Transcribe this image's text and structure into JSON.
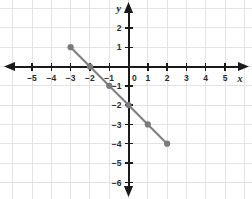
{
  "chart_data": {
    "type": "line",
    "title": "",
    "xlabel": "x",
    "ylabel": "y",
    "xlim": [
      -5.8,
      5.8
    ],
    "ylim": [
      -6.8,
      2.6
    ],
    "grid": true,
    "legend": false,
    "x_ticks": [
      -5,
      -4,
      -3,
      -2,
      -1,
      0,
      1,
      2,
      3,
      4,
      5
    ],
    "x_tick_labels": [
      "−5",
      "−4",
      "−3",
      "−2",
      "−1",
      "0",
      "1",
      "2",
      "3",
      "4",
      "5"
    ],
    "y_ticks": [
      2,
      1,
      -1,
      -2,
      -3,
      -4,
      -5,
      -6
    ],
    "y_tick_labels": [
      "2",
      "1",
      "−1",
      "−2",
      "−3",
      "−4",
      "−5",
      "−6"
    ],
    "series": [
      {
        "name": "line",
        "color": "#808080",
        "x": [
          -3,
          -2,
          -1,
          0,
          1,
          2
        ],
        "y": [
          1,
          0,
          -1,
          -2,
          -3,
          -4
        ],
        "points": [
          {
            "x": -3,
            "y": 1
          },
          {
            "x": -2,
            "y": 0
          },
          {
            "x": -1,
            "y": -1
          },
          {
            "x": 0,
            "y": -2
          },
          {
            "x": 1,
            "y": -3
          },
          {
            "x": 2,
            "y": -4
          }
        ],
        "slope": -1,
        "y_intercept": -2
      }
    ],
    "colors": {
      "grid": "#e3e3e3",
      "axis": "#1a1a1a",
      "series": "#808080",
      "point": "#7a7a7a",
      "background": "#ffffff",
      "tick_label": "#2b2b2b"
    }
  }
}
